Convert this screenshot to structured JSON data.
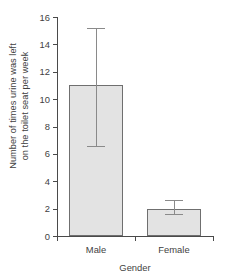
{
  "chart_data": {
    "type": "bar",
    "title": "",
    "subtitle": "",
    "xlabel": "Gender",
    "ylabel": "Number of times urine was left on the toilet seat per week",
    "ylabel_line1": "Number of times urine was left",
    "ylabel_line2": "on the toilet seat per week",
    "categories": [
      "Male",
      "Female"
    ],
    "values": [
      11.0,
      2.0
    ],
    "errors_upper": [
      15.2,
      2.6
    ],
    "errors_lower": [
      6.6,
      1.6
    ],
    "error_plus": [
      4.2,
      0.6
    ],
    "error_minus": [
      4.4,
      0.4
    ],
    "ylim": [
      0,
      16
    ],
    "yticks": [
      0,
      2,
      4,
      6,
      8,
      10,
      12,
      14,
      16
    ],
    "ytick_labels": [
      "0",
      "2",
      "4",
      "6",
      "8",
      "10",
      "12",
      "14",
      "16"
    ],
    "grid": false,
    "legend": false,
    "legend_position": "none",
    "bar_fill_color": "#e3e3e3",
    "bar_border_color": "#6f6f6f",
    "error_bar_color": "#8a8a8a",
    "axis_color": "#4a4a4a",
    "background_color": "#ffffff"
  }
}
